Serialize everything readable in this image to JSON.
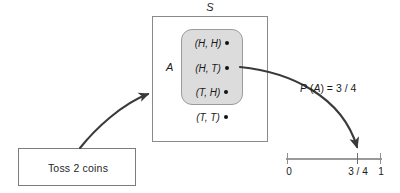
{
  "diagram": {
    "title_implicit": "Probability mapping of an event to the unit interval",
    "source_box": {
      "label": "Toss 2 coins"
    },
    "sample_space": {
      "label": "S",
      "label_name": "sample-space-symbol"
    },
    "event": {
      "label": "A",
      "fill_color": "#dcdcdc",
      "border_color": "#9b9b9b"
    },
    "outcomes": [
      {
        "text": "(H, H)",
        "open": "(",
        "first": "H",
        "comma": ", ",
        "second": "H",
        "close": ")",
        "in_event": true,
        "dot": "bullet-dot"
      },
      {
        "text": "(H, T)",
        "open": "(",
        "first": "H",
        "comma": ", ",
        "second": "T",
        "close": ")",
        "in_event": true,
        "dot": "bullet-dot"
      },
      {
        "text": "(T, H)",
        "open": "(",
        "first": "T",
        "comma": ", ",
        "second": "H",
        "close": ")",
        "in_event": true,
        "dot": "bullet-dot"
      },
      {
        "text": "(T, T)",
        "open": "(",
        "first": "T",
        "comma": ", ",
        "second": "T",
        "close": ")",
        "in_event": false,
        "dot": "bullet-dot"
      }
    ],
    "probability_label": {
      "prefix": "P",
      "arg_open": " (",
      "arg": "A",
      "arg_close": ")",
      "equals": " = ",
      "value": "3 / 4"
    },
    "number_line": {
      "ticks": [
        {
          "label": "0",
          "position": 0.0
        },
        {
          "label": "3 / 4",
          "position": 0.75
        },
        {
          "label": "1",
          "position": 1.0
        }
      ],
      "line_color": "#9a9a9a"
    },
    "arrows": [
      {
        "name": "arrow-experiment-to-sample-space",
        "from": "source-box",
        "to": "sample-space-rect",
        "color": "#3a3a3a"
      },
      {
        "name": "arrow-event-to-probability-value",
        "from": "event-region",
        "to": "number-line-tick-3-4",
        "color": "#3a3a3a"
      }
    ],
    "colors": {
      "ink": "#1a1a1a",
      "box_border": "#7c7c7c",
      "event_fill": "#dcdcdc",
      "arrow": "#3a3a3a",
      "number_line": "#9a9a9a"
    }
  }
}
